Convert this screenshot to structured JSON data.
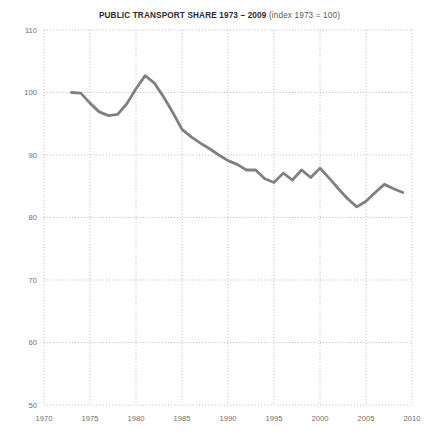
{
  "chart_data": {
    "type": "line",
    "title": "PUBLIC TRANSPORT SHARE 1973 – 2009 (index 1973 = 100)",
    "title_bold_part": "PUBLIC TRANSPORT SHARE 1973 – 2009",
    "title_plain_part": " (index 1973 = 100)",
    "xlabel": "",
    "ylabel": "",
    "xlim": [
      1970,
      2010
    ],
    "ylim": [
      50,
      110
    ],
    "xticks": [
      1970,
      1975,
      1980,
      1985,
      1990,
      1995,
      2000,
      2005,
      2010
    ],
    "xtick_labels": [
      "1970",
      "1975",
      "1980",
      "1985",
      "1990",
      "1995",
      "2000",
      "2005",
      "2010"
    ],
    "yticks": [
      50,
      60,
      70,
      80,
      90,
      100,
      110
    ],
    "ytick_labels": [
      "50",
      "60",
      "70",
      "80",
      "90",
      "100",
      "110"
    ],
    "grid": true,
    "grid_style": "dotted",
    "grid_color": "#b9b9b9",
    "line_color": "#808080",
    "line_width": 2.8,
    "legend": null,
    "series": [
      {
        "name": "Public transport share (index 1973 = 100)",
        "x": [
          1973,
          1974,
          1975,
          1976,
          1977,
          1978,
          1979,
          1980,
          1981,
          1982,
          1983,
          1984,
          1985,
          1986,
          1987,
          1988,
          1989,
          1990,
          1991,
          1992,
          1993,
          1994,
          1995,
          1996,
          1997,
          1998,
          1999,
          2000,
          2001,
          2002,
          2003,
          2004,
          2005,
          2006,
          2007,
          2008,
          2009
        ],
        "values": [
          100.0,
          99.9,
          98.3,
          96.9,
          96.3,
          96.5,
          98.2,
          100.6,
          102.7,
          101.5,
          99.3,
          96.8,
          94.1,
          92.9,
          91.9,
          91.0,
          90.0,
          89.1,
          88.5,
          87.6,
          87.6,
          86.2,
          85.6,
          87.1,
          86.0,
          87.6,
          86.4,
          87.9,
          86.3,
          84.6,
          83.0,
          81.7,
          82.6,
          84.0,
          85.3,
          84.6,
          84.0
        ]
      }
    ],
    "caption": ""
  },
  "figure": {
    "caption_text": ""
  }
}
